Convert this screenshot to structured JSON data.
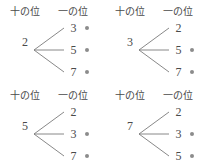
{
  "headers": {
    "tens_place": "十の位",
    "ones_place": "一の位"
  },
  "colors": {
    "text": "#4a4a4a",
    "line": "#7a7a7a",
    "dot": "#8c8c8c",
    "background": "#ffffff"
  },
  "diagram": {
    "type": "tree",
    "digits": [
      "2",
      "3",
      "5",
      "7"
    ],
    "trees": [
      {
        "root": "2",
        "leaves": [
          {
            "value": "3",
            "dot": true
          },
          {
            "value": "5",
            "dot": true
          },
          {
            "value": "7",
            "dot": true
          }
        ]
      },
      {
        "root": "3",
        "leaves": [
          {
            "value": "2",
            "dot": false
          },
          {
            "value": "5",
            "dot": true
          },
          {
            "value": "7",
            "dot": true
          }
        ]
      },
      {
        "root": "5",
        "leaves": [
          {
            "value": "2",
            "dot": false
          },
          {
            "value": "3",
            "dot": true
          },
          {
            "value": "7",
            "dot": true
          }
        ]
      },
      {
        "root": "7",
        "leaves": [
          {
            "value": "2",
            "dot": false
          },
          {
            "value": "3",
            "dot": true
          },
          {
            "value": "5",
            "dot": true
          }
        ]
      }
    ]
  }
}
